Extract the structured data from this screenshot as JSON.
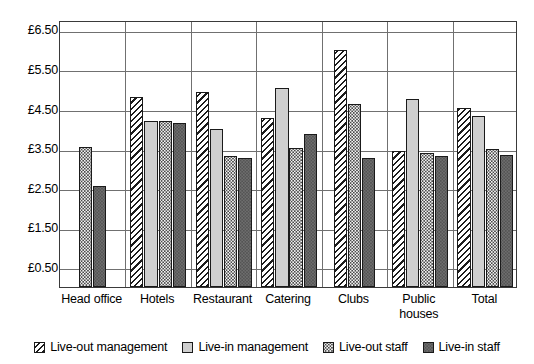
{
  "chart_data": {
    "type": "bar",
    "title": "",
    "xlabel": "",
    "ylabel": "",
    "ylim": [
      0.0,
      6.75
    ],
    "grid": true,
    "legend_position": "bottom",
    "currency_symbol": "£",
    "y_ticks": [
      {
        "value": 0.5,
        "label": "£0.50"
      },
      {
        "value": 1.5,
        "label": "£1.50"
      },
      {
        "value": 2.5,
        "label": "£2.50"
      },
      {
        "value": 3.5,
        "label": "£3.50"
      },
      {
        "value": 4.5,
        "label": "£4.50"
      },
      {
        "value": 5.5,
        "label": "£5.50"
      },
      {
        "value": 6.5,
        "label": "£6.50"
      }
    ],
    "categories": [
      "Head office",
      "Hotels",
      "Restaurant",
      "Catering",
      "Clubs",
      "Public houses",
      "Total"
    ],
    "category_lines": [
      [
        "Head office"
      ],
      [
        "Hotels"
      ],
      [
        "Restaurant"
      ],
      [
        "Catering"
      ],
      [
        "Clubs"
      ],
      [
        "Public",
        "houses"
      ],
      [
        "Total"
      ]
    ],
    "series": [
      {
        "name": "Live-out management",
        "pattern": "hatch",
        "values": [
          null,
          4.8,
          4.93,
          4.28,
          6.0,
          3.45,
          4.52
        ]
      },
      {
        "name": "Live-in management",
        "pattern": "lightgrey",
        "values": [
          null,
          4.2,
          4.0,
          5.03,
          null,
          4.75,
          4.32
        ]
      },
      {
        "name": "Live-out staff",
        "pattern": "dots",
        "values": [
          3.55,
          4.2,
          3.32,
          3.52,
          4.62,
          3.38,
          3.48
        ]
      },
      {
        "name": "Live-in staff",
        "pattern": "darkgrey",
        "values": [
          2.55,
          4.15,
          3.25,
          3.88,
          3.25,
          3.32,
          3.33
        ]
      }
    ]
  },
  "legend": {
    "items": [
      {
        "label": "Live-out management",
        "pattern": "hatch"
      },
      {
        "label": "Live-in management",
        "pattern": "lightgrey"
      },
      {
        "label": "Live-out staff",
        "pattern": "dots"
      },
      {
        "label": "Live-in staff",
        "pattern": "darkgrey"
      }
    ]
  },
  "colors": {
    "axis": "#3a3a3a",
    "gridline": "#707070",
    "bar_outline": "#1a1a1a",
    "light_grey_fill": "#cfcfcf",
    "dark_grey_fill": "#6e6e6e",
    "background": "#ffffff"
  }
}
